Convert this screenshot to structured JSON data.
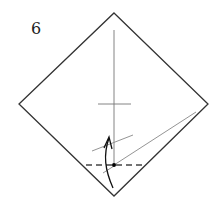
{
  "diagram": {
    "type": "origami-step",
    "step_number": "6",
    "colors": {
      "outline": "#333333",
      "crease": "#777777",
      "dashed_fold": "#444444",
      "arrow": "#111111",
      "dot": "#000000"
    },
    "square": {
      "top": [
        114,
        13
      ],
      "right": [
        208,
        104
      ],
      "bottom": [
        114,
        196
      ],
      "left": [
        19,
        104
      ]
    },
    "elements": [
      {
        "name": "vertical-center-crease",
        "kind": "crease"
      },
      {
        "name": "horizontal-center-tick",
        "kind": "crease"
      },
      {
        "name": "diagonal-reference-line",
        "kind": "crease"
      },
      {
        "name": "short-reference-line",
        "kind": "crease"
      },
      {
        "name": "valley-fold-line",
        "kind": "dashed"
      },
      {
        "name": "reference-point-dot",
        "kind": "dot"
      },
      {
        "name": "fold-up-arrow",
        "kind": "arrow"
      }
    ]
  }
}
